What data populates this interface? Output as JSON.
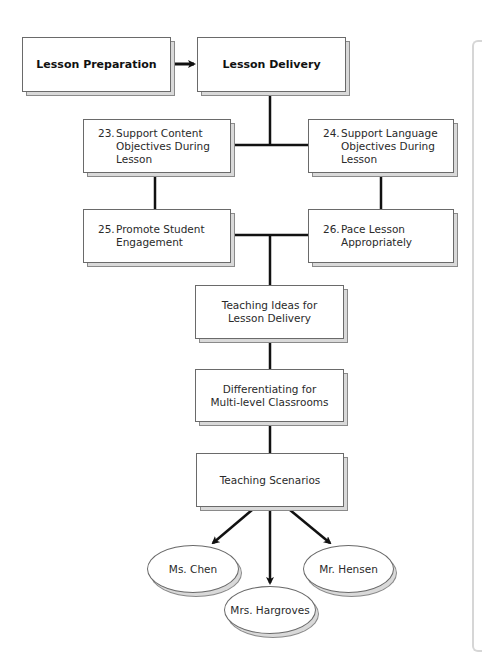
{
  "diagram": {
    "top_row": {
      "preparation": "Lesson Preparation",
      "delivery": "Lesson Delivery"
    },
    "features": [
      {
        "number": "23.",
        "line1": "Support Content",
        "line2": "Objectives During",
        "line3": "Lesson"
      },
      {
        "number": "24.",
        "line1": "Support Language",
        "line2": "Objectives During",
        "line3": "Lesson"
      },
      {
        "number": "25.",
        "line1": "Promote Student",
        "line2": "Engagement",
        "line3": ""
      },
      {
        "number": "26.",
        "line1": "Pace Lesson",
        "line2": "Appropriately",
        "line3": ""
      }
    ],
    "sections": [
      {
        "line1": "Teaching Ideas for",
        "line2": "Lesson Delivery"
      },
      {
        "line1": "Differentiating for",
        "line2": "Multi-level Classrooms"
      },
      {
        "line1": "Teaching Scenarios",
        "line2": ""
      }
    ],
    "scenarios": [
      "Ms. Chen",
      "Mrs. Hargroves",
      "Mr. Hensen"
    ]
  }
}
